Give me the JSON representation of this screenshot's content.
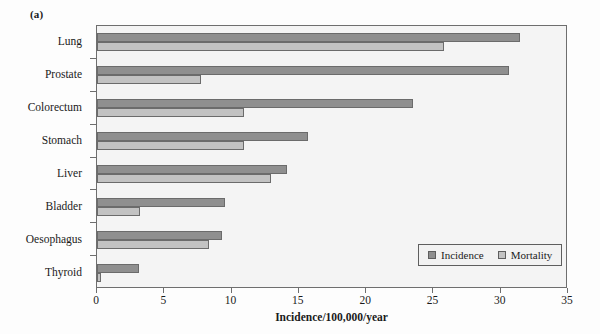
{
  "panel": {
    "label": "(a)"
  },
  "chart_data": {
    "type": "bar",
    "orientation": "horizontal",
    "title": "",
    "subtitle": "",
    "xlabel": "Incidence/100,000/year",
    "ylabel": "",
    "xlim": [
      0,
      35
    ],
    "xticks": [
      0,
      5,
      10,
      15,
      20,
      25,
      30,
      35
    ],
    "grid": false,
    "legend_position": "bottom-right",
    "categories": [
      "Lung",
      "Prostate",
      "Colorectum",
      "Stomach",
      "Liver",
      "Bladder",
      "Oesophagus",
      "Thyroid"
    ],
    "series": [
      {
        "name": "Incidence",
        "color": "#8f8f8f",
        "values": [
          31.4,
          30.6,
          23.5,
          15.7,
          14.1,
          9.5,
          9.3,
          3.1
        ]
      },
      {
        "name": "Mortality",
        "color": "#c2c2c2",
        "values": [
          25.8,
          7.7,
          10.9,
          10.9,
          12.9,
          3.2,
          8.3,
          0.3
        ]
      }
    ]
  },
  "colors": {
    "incidence": "#8f8f8f",
    "mortality": "#c2c2c2",
    "axis": "#6e6e6e",
    "plot_background": "#f4f4f4"
  }
}
